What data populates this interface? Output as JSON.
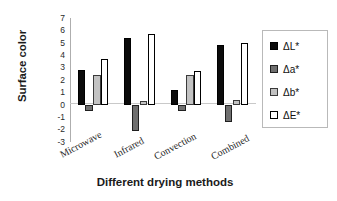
{
  "chart_data": {
    "type": "bar",
    "title": "",
    "xlabel": "Different drying methods",
    "ylabel": "Surface color",
    "categories": [
      "Microwave",
      "Infrared",
      "Convection",
      "Combined"
    ],
    "series": [
      {
        "name": "ΔL*",
        "key": "dL",
        "color": "#0b0b0b",
        "values": [
          2.8,
          5.35,
          1.2,
          4.85
        ]
      },
      {
        "name": "Δa*",
        "key": "da",
        "color": "#6f6f6f",
        "values": [
          -0.5,
          -2.15,
          -0.5,
          -1.35
        ]
      },
      {
        "name": "Δb*",
        "key": "db",
        "color": "#c2c2c2",
        "values": [
          2.4,
          0.3,
          2.4,
          0.4
        ]
      },
      {
        "name": "ΔE*",
        "key": "dE",
        "color": "#ffffff",
        "values": [
          3.7,
          5.75,
          2.75,
          5.0
        ]
      }
    ],
    "ylim": [
      -3,
      7
    ],
    "yticks": [
      7,
      6,
      5,
      4,
      3,
      2,
      1,
      0,
      -1,
      -2,
      -3
    ],
    "ytick_labels": [
      "7",
      "6",
      "5",
      "4",
      "3",
      "2",
      "1",
      "0",
      "-1",
      "-2",
      "-3"
    ],
    "grid": false,
    "zero_line": true,
    "legend_position": "right",
    "legend_entries": [
      "ΔL*",
      "Δa*",
      "Δb*",
      "ΔE*"
    ]
  }
}
